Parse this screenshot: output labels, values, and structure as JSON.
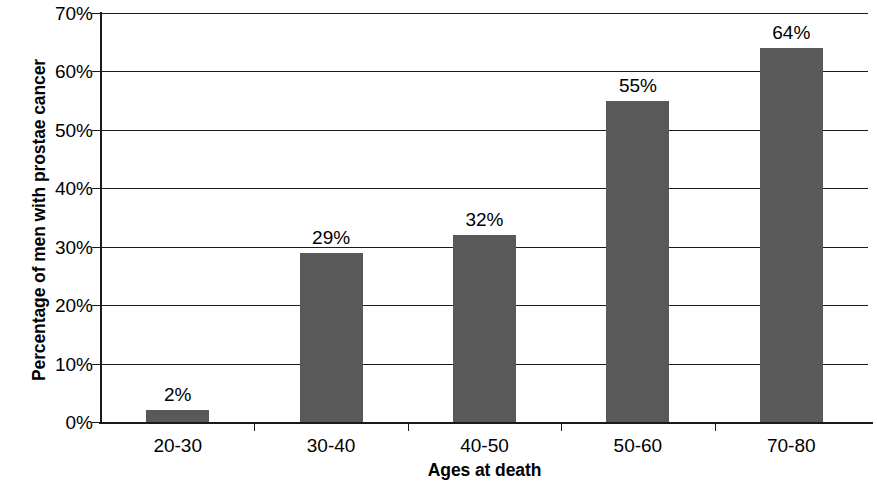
{
  "chart_data": {
    "type": "bar",
    "title": "",
    "subtitle": "",
    "xlabel": "Ages at death",
    "ylabel": "Percentage of men with prostae cancer",
    "categories": [
      "20-30",
      "30-40",
      "40-50",
      "50-60",
      "70-80"
    ],
    "values": [
      2,
      29,
      32,
      55,
      64
    ],
    "value_labels": [
      "2%",
      "29%",
      "32%",
      "55%",
      "64%"
    ],
    "series": [
      {
        "name": "Percentage of men with prostae cancer",
        "values": [
          2,
          29,
          32,
          55,
          64
        ],
        "color": "#595959"
      }
    ],
    "ylim": [
      0,
      70
    ],
    "ytick_values": [
      0,
      10,
      20,
      30,
      40,
      50,
      60,
      70
    ],
    "ytick_labels": [
      "0%",
      "10%",
      "20%",
      "30%",
      "40%",
      "50%",
      "60%",
      "70%"
    ],
    "grid": "horizontal",
    "grid_color": "#1a1a1a",
    "legend": "none",
    "background_color": "#ffffff",
    "axis_color": "#1a1a1a",
    "bar_color": "#595959",
    "unit": "percent"
  }
}
